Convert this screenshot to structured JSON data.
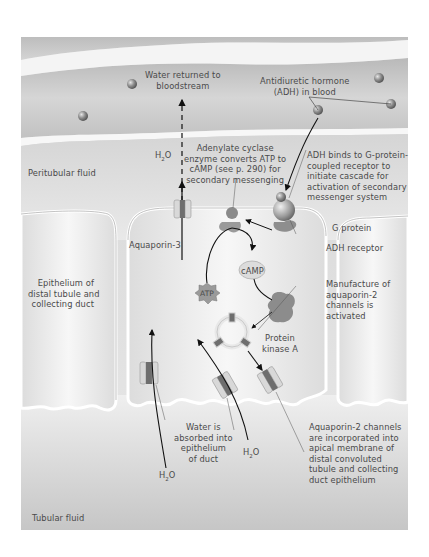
{
  "diagram": {
    "regions": {
      "blood_vessel": "bloodstream",
      "peritubular_fluid": "Peritubular fluid",
      "epithelium": "Epithelium of\ndistal tubule and\ncollecting duct",
      "tubular_fluid": "Tubular fluid"
    },
    "labels": {
      "water_returned": "Water returned to\nbloodstream",
      "adh_in_blood": "Antidiuretic hormone\n(ADH) in blood",
      "adenylate_cyclase": "Adenylate cyclase\nenzyme converts ATP to\ncAMP (see p. 290) for\nsecondary messenging",
      "adh_binds": "ADH binds to G-protein-\ncoupled receptor to\ninitiate cascade for\nactivation of secondary\nmessenger system",
      "g_protein": "G protein",
      "adh_receptor": "ADH receptor",
      "aquaporin3": "Aquaporin-3",
      "camp": "cAMP",
      "atp": "ATP",
      "manufacture": "Manufacture of\naquaporin-2\nchannels is\nactivated",
      "protein_kinase": "Protein\nkinase A",
      "water_absorbed": "Water is\nabsorbed into\nepithelium\nof duct",
      "aquaporin2": "Aquaporin-2 channels\nare incorporated into\napical membrane of\ndistal convoluted\ntubule and collecting\nduct epithelium"
    },
    "water": {
      "symbol": "H",
      "subscript": "2",
      "tail": "O"
    },
    "colors": {
      "vessel": "#c4c4c4",
      "fluid": "#e2e2e2",
      "cell": "#f1f1f1",
      "membrane": "#ffffff",
      "protein": "#8a8a8a",
      "channel": "#6e6e6e",
      "text": "#4a4a4a"
    }
  }
}
